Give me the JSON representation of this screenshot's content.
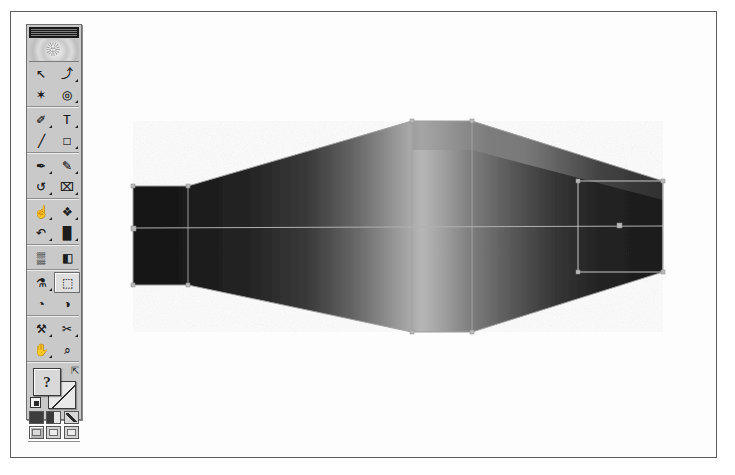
{
  "app": {
    "name": "Image Editor",
    "window_title": "Toolbox"
  },
  "toolbox": {
    "title_label": "Toolbox",
    "logo_name": "application-logo",
    "tools": [
      {
        "id": "move-tool",
        "label": "Move",
        "glyph": "↖",
        "menu": false,
        "selected": false
      },
      {
        "id": "lasso-tool",
        "label": "Lasso",
        "glyph": "⤴",
        "menu": true,
        "selected": false
      },
      {
        "id": "magic-wand-tool",
        "label": "Magic Wand",
        "glyph": "✶",
        "menu": false,
        "selected": false
      },
      {
        "id": "marquee-tool",
        "label": "Marquee",
        "glyph": "◎",
        "menu": true,
        "selected": false
      },
      {
        "id": "pen-tool",
        "label": "Pen",
        "glyph": "✐",
        "menu": true,
        "selected": false
      },
      {
        "id": "type-tool",
        "label": "Type",
        "glyph": "T",
        "menu": true,
        "selected": false
      },
      {
        "id": "line-tool",
        "label": "Line",
        "glyph": "╱",
        "menu": false,
        "selected": false
      },
      {
        "id": "rectangle-tool",
        "label": "Rectangle",
        "glyph": "□",
        "menu": true,
        "selected": false
      },
      {
        "id": "paintbrush-tool",
        "label": "Paintbrush",
        "glyph": "✒",
        "menu": true,
        "selected": false
      },
      {
        "id": "pencil-tool",
        "label": "Pencil",
        "glyph": "✎",
        "menu": true,
        "selected": false
      },
      {
        "id": "rotate-tool",
        "label": "Rotate",
        "glyph": "↺",
        "menu": true,
        "selected": false
      },
      {
        "id": "crop-tool",
        "label": "Crop",
        "glyph": "⌧",
        "menu": true,
        "selected": false
      },
      {
        "id": "smudge-tool",
        "label": "Smudge",
        "glyph": "☝",
        "menu": true,
        "selected": false
      },
      {
        "id": "dodge-burn-tool",
        "label": "Dodge and Burn",
        "glyph": "❖",
        "menu": true,
        "selected": false
      },
      {
        "id": "history-brush-tool",
        "label": "History Brush",
        "glyph": "↶",
        "menu": true,
        "selected": false
      },
      {
        "id": "levels-tool",
        "label": "Levels",
        "glyph": "█",
        "menu": true,
        "selected": false
      },
      {
        "id": "pattern-tool",
        "label": "Pattern Stamp",
        "glyph": "▒",
        "menu": false,
        "selected": false
      },
      {
        "id": "gradient-tool",
        "label": "Gradient",
        "glyph": "◧",
        "menu": false,
        "selected": false
      },
      {
        "id": "eyedropper-tool",
        "label": "Eyedropper",
        "glyph": "⚗",
        "menu": true,
        "selected": false
      },
      {
        "id": "shape-select-tool",
        "label": "Shape Select",
        "glyph": "⬚",
        "menu": false,
        "selected": true
      },
      {
        "id": "blur-tool",
        "label": "Blur",
        "glyph": "◔",
        "menu": false,
        "selected": false
      },
      {
        "id": "sharpen-tool",
        "label": "Sharpen",
        "glyph": "◑",
        "menu": false,
        "selected": false
      },
      {
        "id": "wrench-tool",
        "label": "Wrench",
        "glyph": "⚒",
        "menu": true,
        "selected": false
      },
      {
        "id": "scissors-tool",
        "label": "Scissors",
        "glyph": "✂",
        "menu": true,
        "selected": false
      },
      {
        "id": "hand-tool",
        "label": "Hand",
        "glyph": "✋",
        "menu": true,
        "selected": false
      },
      {
        "id": "zoom-tool",
        "label": "Zoom",
        "glyph": "⌕",
        "menu": false,
        "selected": false
      }
    ],
    "group_breaks": [
      4,
      8,
      12,
      16,
      18,
      22
    ],
    "colors": {
      "foreground_label": "?",
      "foreground_hex": "#d8d8d8",
      "background_hex": "#e9e9e9",
      "swap_icon": "swap-colors-icon",
      "default_icon": "default-colors-icon"
    },
    "mask_modes": [
      {
        "id": "standard-mode",
        "label": "Standard Mode",
        "style": "dark",
        "selected": true
      },
      {
        "id": "quick-mask-mode",
        "label": "Quick Mask Mode",
        "style": "half",
        "selected": false
      },
      {
        "id": "edit-mode",
        "label": "Edit Mode",
        "style": "slash",
        "selected": false
      }
    ],
    "screen_modes": [
      {
        "id": "standard-screen-mode",
        "label": "Standard Screen Mode",
        "selected": true
      },
      {
        "id": "full-screen-menu-mode",
        "label": "Full Screen With Menu Bar",
        "selected": false
      },
      {
        "id": "full-screen-mode",
        "label": "Full Screen Mode",
        "selected": false
      }
    ]
  },
  "canvas": {
    "name": "document-canvas",
    "background_hex": "#fdfdfd",
    "object_name": "gradient-mesh-object",
    "shape_description": "Shaded three-dimensional bow-tie / spool form with gradient fill and mesh control points",
    "outline_color_hex": "#a9a9a9",
    "handle_color_hex": "#b5b5b5",
    "selection_color_hex": "#c4c4c4",
    "shape_outline": [
      [
        133,
        186
      ],
      [
        188,
        186
      ],
      [
        412,
        121
      ],
      [
        472,
        121
      ],
      [
        663,
        181
      ],
      [
        663,
        272
      ],
      [
        472,
        332
      ],
      [
        412,
        332
      ],
      [
        188,
        285
      ],
      [
        133,
        285
      ]
    ],
    "mesh_lines": [
      {
        "id": "mesh-line-left-vertical",
        "from": [
          188,
          186
        ],
        "to": [
          188,
          285
        ]
      },
      {
        "id": "mesh-line-mid-vertical",
        "from": [
          412,
          121
        ],
        "to": [
          412,
          332
        ]
      },
      {
        "id": "mesh-line-right-vertical",
        "from": [
          472,
          121
        ],
        "to": [
          472,
          332
        ]
      },
      {
        "id": "mesh-line-horizontal",
        "from": [
          133,
          228
        ],
        "to": [
          663,
          226
        ]
      }
    ],
    "selection_rect": {
      "x": 578,
      "y": 181,
      "w": 85,
      "h": 91
    },
    "anchor_points": [
      [
        133,
        186
      ],
      [
        188,
        186
      ],
      [
        412,
        121
      ],
      [
        472,
        121
      ],
      [
        663,
        181
      ],
      [
        663,
        272
      ],
      [
        472,
        332
      ],
      [
        412,
        332
      ],
      [
        188,
        285
      ],
      [
        133,
        285
      ],
      [
        133,
        228
      ],
      [
        578,
        181
      ],
      [
        663,
        181
      ],
      [
        578,
        272
      ],
      [
        663,
        272
      ],
      [
        620,
        226
      ]
    ]
  }
}
